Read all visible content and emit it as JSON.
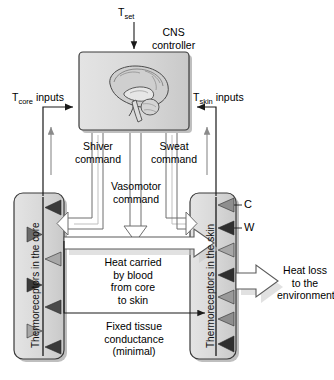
{
  "figure": {
    "background_color": "#ffffff",
    "box_fill": "#d6d6d6",
    "box_fill_light": "#e0e0e0",
    "box_stroke": "#3a3a3a",
    "shadow_color": "#bfbfbf",
    "line_color": "#1a1a1a",
    "gray_arrow_color": "#8a8a8a",
    "triangle_dark": "#3a3a3a",
    "triangle_light": "#a8a8a8"
  },
  "labels": {
    "t_set": "T",
    "t_set_sub": "set",
    "cns_line1": "CNS",
    "cns_line2": "controller",
    "t_core": "T",
    "t_core_sub": "core",
    "t_core_rest": " inputs",
    "t_skin": "T",
    "t_skin_sub": "skin",
    "t_skin_rest": " inputs",
    "shiver_line1": "Shiver",
    "shiver_line2": "command",
    "sweat_line1": "Sweat",
    "sweat_line2": "command",
    "vasomotor_line1": "Vasomotor",
    "vasomotor_line2": "command",
    "heat_carried_line1": "Heat carried",
    "heat_carried_line2": "by blood",
    "heat_carried_line3": "from core",
    "heat_carried_line4": "to skin",
    "fixed_line1": "Fixed tissue",
    "fixed_line2": "conductance",
    "fixed_line3": "(minimal)",
    "heat_loss_line1": "Heat loss",
    "heat_loss_line2": "to the",
    "heat_loss_line3": "environment",
    "core_box": "Thermoreceptors in the core",
    "skin_box": "Thermoreceptors in the skin",
    "cold_receptor": "C",
    "warm_receptor": "W"
  },
  "diagram_structure": {
    "nodes": [
      {
        "id": "cns-controller",
        "label": "CNS controller",
        "contains": "brain-sagittal-illustration"
      },
      {
        "id": "core-receptors",
        "label": "Thermoreceptors in the core"
      },
      {
        "id": "skin-receptors",
        "label": "Thermoreceptors in the skin"
      }
    ],
    "inputs": [
      {
        "id": "t-set",
        "label": "T set",
        "target": "cns-controller",
        "direction": "down"
      },
      {
        "id": "t-core-inputs",
        "label": "T core inputs",
        "source": "core-receptors",
        "target": "cns-controller"
      },
      {
        "id": "t-skin-inputs",
        "label": "T skin inputs",
        "source": "skin-receptors",
        "target": "cns-controller"
      }
    ],
    "outputs": [
      {
        "id": "shiver-command",
        "label": "Shiver command",
        "source": "cns-controller",
        "target": "core-receptors"
      },
      {
        "id": "sweat-command",
        "label": "Sweat command",
        "source": "cns-controller",
        "target": "skin-receptors"
      },
      {
        "id": "vasomotor-command",
        "label": "Vasomotor command",
        "source": "cns-controller",
        "target": "heat-carried-by-blood"
      }
    ],
    "flows": [
      {
        "id": "heat-carried-by-blood",
        "label": "Heat carried by blood from core to skin",
        "source": "core-receptors",
        "target": "skin-receptors",
        "style": "wide-block-arrow"
      },
      {
        "id": "fixed-tissue-conductance",
        "label": "Fixed tissue conductance (minimal)",
        "source": "core-receptors",
        "target": "skin-receptors",
        "style": "thin-line-arrow"
      },
      {
        "id": "heat-loss",
        "label": "Heat loss to the environment",
        "source": "skin-receptors",
        "target": "environment",
        "style": "wide-block-arrow"
      }
    ],
    "receptor_legend": [
      {
        "symbol": "C",
        "meaning": "cold receptor",
        "fill": "#a8a8a8"
      },
      {
        "symbol": "W",
        "meaning": "warm receptor",
        "fill": "#3a3a3a"
      }
    ]
  }
}
